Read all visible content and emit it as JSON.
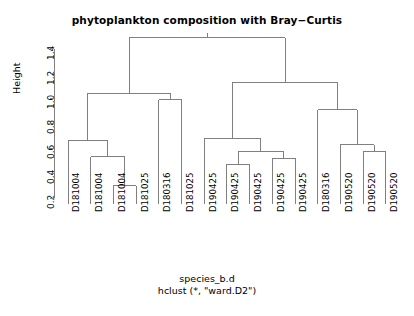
{
  "plot": {
    "title": "phytoplankton composition with Bray−Curtis",
    "caption_line1": "species_b.d",
    "caption_line2": "hclust (*, \"ward.D2\")",
    "y_axis_label": "Height",
    "line_color": "#808080",
    "text_color": "#000000",
    "background": "#ffffff"
  },
  "chart_data": {
    "type": "line",
    "subtype": "dendrogram",
    "title": "phytoplankton composition with Bray−Curtis",
    "xlabel": "species_b.d",
    "sublabel": "hclust (*, \"ward.D2\")",
    "ylabel": "Height",
    "ylim": [
      0.15,
      1.52
    ],
    "ytick_values": [
      0.2,
      0.4,
      0.6,
      0.8,
      1.0,
      1.2,
      1.4
    ],
    "ytick_labels": [
      "0.2",
      "0.4",
      "0.6",
      "0.8",
      "1.0",
      "1.2",
      "1.4"
    ],
    "grid": false,
    "legend": "none",
    "method": "ward.D2",
    "distance": "Bray-Curtis",
    "n_leaves": 15,
    "leaf_labels": [
      "D181004",
      "D181004",
      "D181004",
      "D181025",
      "D180316",
      "D181025",
      "D190425",
      "D190425",
      "D190425",
      "D190425",
      "D190425",
      "D180316",
      "D190520",
      "D190520",
      "D190520"
    ],
    "merges": [
      {
        "id": "m1",
        "left": {
          "type": "leaf",
          "index": 2
        },
        "right": {
          "type": "leaf",
          "index": 3
        },
        "height": 0.3
      },
      {
        "id": "m2",
        "left": {
          "type": "leaf",
          "index": 1
        },
        "right": {
          "type": "node",
          "id": "m1"
        },
        "height": 0.53
      },
      {
        "id": "m3",
        "left": {
          "type": "leaf",
          "index": 0
        },
        "right": {
          "type": "node",
          "id": "m2"
        },
        "height": 0.66
      },
      {
        "id": "m4",
        "left": {
          "type": "leaf",
          "index": 4
        },
        "right": {
          "type": "leaf",
          "index": 5
        },
        "height": 0.99
      },
      {
        "id": "m5",
        "left": {
          "type": "node",
          "id": "m3"
        },
        "right": {
          "type": "node",
          "id": "m4"
        },
        "height": 1.04
      },
      {
        "id": "m6",
        "left": {
          "type": "leaf",
          "index": 7
        },
        "right": {
          "type": "leaf",
          "index": 8
        },
        "height": 0.47
      },
      {
        "id": "m7",
        "left": {
          "type": "leaf",
          "index": 9
        },
        "right": {
          "type": "leaf",
          "index": 10
        },
        "height": 0.52
      },
      {
        "id": "m8",
        "left": {
          "type": "node",
          "id": "m6"
        },
        "right": {
          "type": "node",
          "id": "m7"
        },
        "height": 0.57
      },
      {
        "id": "m9",
        "left": {
          "type": "leaf",
          "index": 6
        },
        "right": {
          "type": "node",
          "id": "m8"
        },
        "height": 0.675
      },
      {
        "id": "m10",
        "left": {
          "type": "leaf",
          "index": 13
        },
        "right": {
          "type": "leaf",
          "index": 14
        },
        "height": 0.57
      },
      {
        "id": "m11",
        "left": {
          "type": "leaf",
          "index": 12
        },
        "right": {
          "type": "node",
          "id": "m10"
        },
        "height": 0.63
      },
      {
        "id": "m12",
        "left": {
          "type": "leaf",
          "index": 11
        },
        "right": {
          "type": "node",
          "id": "m11"
        },
        "height": 0.91
      },
      {
        "id": "m13",
        "left": {
          "type": "node",
          "id": "m9"
        },
        "right": {
          "type": "node",
          "id": "m12"
        },
        "height": 1.13
      },
      {
        "id": "m14",
        "left": {
          "type": "node",
          "id": "m5"
        },
        "right": {
          "type": "node",
          "id": "m13"
        },
        "height": 1.49
      }
    ]
  },
  "geometry": {
    "leaf_x_start": 68,
    "leaf_x_step": 22.7,
    "axis_x": 54,
    "axis_top_y": 40,
    "axis_bottom_y": 198,
    "y_value_top": 1.47,
    "y_value_bottom": 0.2,
    "leaf_base_y": 204,
    "leaf_label_y": 212,
    "tick_label_x": 46
  }
}
